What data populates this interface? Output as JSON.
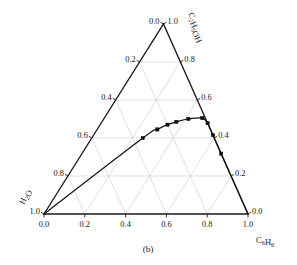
{
  "figure": {
    "caption": "(b)",
    "type": "ternary-phase-diagram"
  },
  "vertices": {
    "top": "C₂H₅OH",
    "left": "H₂O",
    "right": "C₆H₆"
  },
  "axes": {
    "bottom": {
      "name": "C₆H₆",
      "ticks": [
        "0.0",
        "0.2",
        "0.4",
        "0.6",
        "0.8",
        "1.0"
      ]
    },
    "left": {
      "name": "H₂O",
      "ticks": [
        "0.0",
        "0.2",
        "0.4",
        "0.6",
        "0.8",
        "1.0"
      ]
    },
    "right": {
      "name": "C₂H₅OH",
      "ticks": [
        "1.0",
        "0.8",
        "0.6",
        "0.4",
        "0.2",
        "0.0"
      ]
    },
    "apex_value": "1.0",
    "left_bottom_value": "1.0",
    "right_bottom_value": "0.0"
  },
  "colors": {
    "axis": "#1a1a1a",
    "grid": "#d2d2d2",
    "curve": "#141414",
    "marker": "#0d0d0d",
    "background": "#ffffff"
  },
  "chart_data": {
    "type": "scatter",
    "title": "",
    "subtitle": "",
    "xlabel": "C₆H₆",
    "ylabel": "C₂H₅OH",
    "zlabel": "H₂O",
    "grid": true,
    "legend": null,
    "axis_range": [
      0.0,
      1.0
    ],
    "tick_step": 0.2,
    "series": [
      {
        "name": "binodal curve",
        "marker": "filled-square",
        "line": "solid",
        "points": [
          {
            "benzene": 0.0,
            "ethanol": 0.0,
            "water": 1.0
          },
          {
            "benzene": 0.25,
            "ethanol": 0.4,
            "water": 0.35
          },
          {
            "benzene": 0.295,
            "ethanol": 0.445,
            "water": 0.26
          },
          {
            "benzene": 0.33,
            "ethanol": 0.47,
            "water": 0.2
          },
          {
            "benzene": 0.365,
            "ethanol": 0.485,
            "water": 0.15
          },
          {
            "benzene": 0.415,
            "ethanol": 0.5,
            "water": 0.085
          },
          {
            "benzene": 0.48,
            "ethanol": 0.505,
            "water": 0.015
          },
          {
            "benzene": 0.54,
            "ethanol": 0.495,
            "water": 0.0
          },
          {
            "benzene": 0.62,
            "ethanol": 0.44,
            "water": 0.0
          },
          {
            "benzene": 0.73,
            "ethanol": 0.34,
            "water": 0.0
          },
          {
            "benzene": 1.0,
            "ethanol": 0.0,
            "water": 0.0
          }
        ]
      }
    ]
  },
  "tick_positions": {
    "bottom": [
      0.0,
      0.2,
      0.4,
      0.6,
      0.8,
      1.0
    ],
    "left": [
      0.0,
      0.2,
      0.4,
      0.6,
      0.8,
      1.0
    ],
    "right": [
      0.0,
      0.2,
      0.4,
      0.6,
      0.8,
      1.0
    ]
  }
}
